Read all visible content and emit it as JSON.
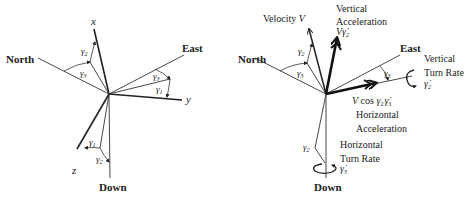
{
  "left_diagram": {
    "north": "North",
    "east": "East",
    "down": "Down",
    "x_axis": "x",
    "y_axis": "y",
    "z_axis": "z",
    "gamma1": "γ",
    "gamma1_sub": "1",
    "gamma2": "γ",
    "gamma2_sub": "2",
    "gamma3": "γ",
    "gamma3_sub": "3"
  },
  "right_diagram": {
    "north": "North",
    "east": "East",
    "down": "Down",
    "velocity": "Velocity ",
    "velocity_sym": "V",
    "vertical_accel_line1": "Vertical",
    "vertical_accel_line2": "Acceleration",
    "vertical_accel_sym": "V",
    "vertical_accel_gamma": "γ̇",
    "vertical_accel_sub": "2",
    "vertical_turn_line1": "Vertical",
    "vertical_turn_line2": "Turn Rate",
    "vertical_turn_gamma": "γ̇",
    "vertical_turn_sub": "2",
    "horizontal_accel_expr_v": "V",
    "horizontal_accel_expr_cos": " cos ",
    "horizontal_accel_expr_g2": "γ",
    "horizontal_accel_expr_g2_sub": "2",
    "horizontal_accel_expr_g3": "γ̇",
    "horizontal_accel_expr_g3_sub": "3",
    "horizontal_accel_line1": "Horizontal",
    "horizontal_accel_line2": "Acceleration",
    "horizontal_turn_line1": "Horizontal",
    "horizontal_turn_line2": "Turn Rate",
    "horizontal_turn_gamma": "γ̇",
    "horizontal_turn_sub": "3",
    "gamma2": "γ",
    "gamma2_sub": "2",
    "gamma3": "γ",
    "gamma3_sub": "3"
  },
  "colors": {
    "line": "#333333",
    "text": "#222222",
    "background": "#ffffff"
  }
}
